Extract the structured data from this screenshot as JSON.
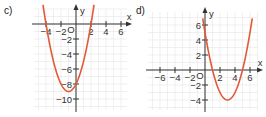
{
  "chart_data": [
    {
      "type": "line",
      "panel_label": "c)",
      "title": "",
      "xlabel": "x",
      "ylabel": "y",
      "origin_label": "O",
      "xlim": [
        -5.6,
        6.7
      ],
      "ylim": [
        -11.5,
        1.1
      ],
      "grid": true,
      "x_ticks": [
        -4,
        -2,
        2,
        4,
        6
      ],
      "x_tick_labels": [
        "−4",
        "−2",
        "2",
        "4",
        "6"
      ],
      "y_ticks": [
        -2,
        -4,
        -6,
        -8,
        -10
      ],
      "y_tick_labels": [
        "−2",
        "−4",
        "−6",
        "−8",
        "−10"
      ],
      "series": [
        {
          "name": "parabola c",
          "function": "x^2 + 2x - 8",
          "color": "#e05a3a",
          "vertex": [
            -1,
            -9
          ],
          "roots": [
            -4,
            2
          ],
          "y_intercept": -8,
          "x": [
            -4.4,
            -4,
            -3,
            -2,
            -1,
            0,
            1,
            2,
            2.4
          ],
          "y": [
            1.76,
            0,
            -5,
            -8,
            -9,
            -8,
            -5,
            0,
            1.76
          ]
        }
      ]
    },
    {
      "type": "line",
      "panel_label": "d)",
      "title": "",
      "xlabel": "x",
      "ylabel": "y",
      "origin_label": "O",
      "xlim": [
        -7.6,
        7.1
      ],
      "ylim": [
        -5.4,
        7.3
      ],
      "grid": true,
      "x_ticks": [
        -6,
        -4,
        -2,
        2,
        4,
        6
      ],
      "x_tick_labels": [
        "−6",
        "−4",
        "−2",
        "2",
        "4",
        "6"
      ],
      "y_ticks": [
        6,
        4,
        2,
        -2,
        -4
      ],
      "y_tick_labels": [
        "6",
        "4",
        "2",
        "−2",
        "−4"
      ],
      "series": [
        {
          "name": "parabola d",
          "function": "x^2 - 6x + 5",
          "color": "#e05a3a",
          "vertex": [
            3,
            -4
          ],
          "roots": [
            1,
            5
          ],
          "y_intercept": 5,
          "x": [
            -0.3,
            0,
            1,
            2,
            3,
            4,
            5,
            6,
            6.3
          ],
          "y": [
            6.89,
            5,
            0,
            -3,
            -4,
            -3,
            0,
            5,
            6.89
          ]
        }
      ]
    }
  ]
}
